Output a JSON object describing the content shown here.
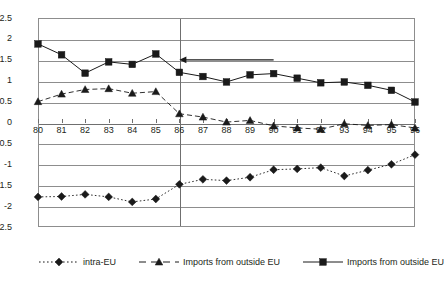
{
  "chart_data": {
    "type": "line",
    "title": "",
    "xlabel": "",
    "ylabel": "",
    "categories": [
      "80",
      "81",
      "82",
      "83",
      "84",
      "85",
      "86",
      "87",
      "88",
      "89",
      "90",
      "91",
      "92",
      "93",
      "94",
      "95",
      "96"
    ],
    "ylim": [
      -2.5,
      2.5
    ],
    "ytick_labels": [
      "2.5",
      "2",
      "1.5",
      "1",
      "0.5",
      "0",
      "-0.5",
      "-1",
      "-1.5",
      "-2",
      "-2.5"
    ],
    "ytick_values": [
      2.5,
      2,
      1.5,
      1,
      0.5,
      0,
      -0.5,
      -1,
      -1.5,
      -2,
      -2.5
    ],
    "grid": true,
    "legend_position": "bottom",
    "series": [
      {
        "name": "intra-EU",
        "marker": "diamond",
        "line_style": "dotted",
        "color": "#1a1a1a",
        "values": [
          -1.78,
          -1.77,
          -1.72,
          -1.78,
          -1.9,
          -1.83,
          -1.48,
          -1.36,
          -1.39,
          -1.31,
          -1.13,
          -1.11,
          -1.08,
          -1.28,
          -1.14,
          -1.0,
          -0.77
        ]
      },
      {
        "name": "Imports from outside EU",
        "marker": "triangle",
        "line_style": "dashed",
        "color": "#1a1a1a",
        "values": [
          0.5,
          0.68,
          0.79,
          0.81,
          0.7,
          0.74,
          0.21,
          0.13,
          0.01,
          0.05,
          -0.08,
          -0.13,
          -0.16,
          -0.03,
          -0.07,
          -0.05,
          -0.13
        ]
      },
      {
        "name": "Imports from outside EU",
        "marker": "square",
        "line_style": "solid",
        "color": "#1a1a1a",
        "values": [
          1.88,
          1.62,
          1.18,
          1.45,
          1.39,
          1.64,
          1.2,
          1.1,
          0.97,
          1.14,
          1.17,
          1.06,
          0.95,
          0.97,
          0.89,
          0.77,
          0.49
        ]
      }
    ],
    "annotations": [
      {
        "type": "arrow",
        "direction": "left",
        "y_value": 1.5,
        "x_start": "90",
        "x_end": "86"
      },
      {
        "type": "vertical-divider",
        "x_value": "86"
      }
    ]
  },
  "legend": {
    "items": [
      {
        "label": "intra-EU",
        "marker": "diamond",
        "line_style": "dotted"
      },
      {
        "label": "Imports from outside EU",
        "marker": "triangle",
        "line_style": "dashed"
      },
      {
        "label": "Imports from outside EU",
        "marker": "square",
        "line_style": "solid"
      }
    ]
  }
}
